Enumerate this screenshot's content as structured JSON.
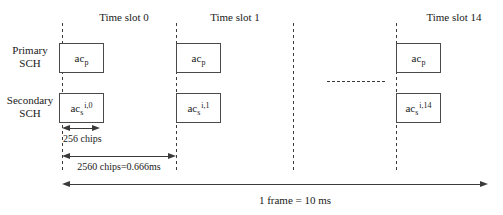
{
  "diagram": {
    "row_labels": {
      "primary_line1": "Primary",
      "primary_line2": "SCH",
      "secondary_line1": "Secondary",
      "secondary_line2": "SCH"
    },
    "slots": [
      {
        "label": "Time slot 0",
        "primary_code": {
          "base": "ac",
          "sub": "p"
        },
        "secondary_code": {
          "base": "ac",
          "sub": "s",
          "sup": "i,0"
        }
      },
      {
        "label": "Time slot 1",
        "primary_code": {
          "base": "ac",
          "sub": "p"
        },
        "secondary_code": {
          "base": "ac",
          "sub": "s",
          "sup": "i,1"
        }
      },
      {
        "label": "Time slot 14",
        "primary_code": {
          "base": "ac",
          "sub": "p"
        },
        "secondary_code": {
          "base": "ac",
          "sub": "s",
          "sup": "i,14"
        }
      }
    ],
    "annotations": {
      "chips_256": "256 chips",
      "slot_duration": "2560 chips=0.666ms",
      "frame_duration": "1 frame = 10 ms"
    },
    "colors": {
      "line": "#3a3a3a",
      "text": "#1a1a1a",
      "background": "#ffffff"
    }
  }
}
